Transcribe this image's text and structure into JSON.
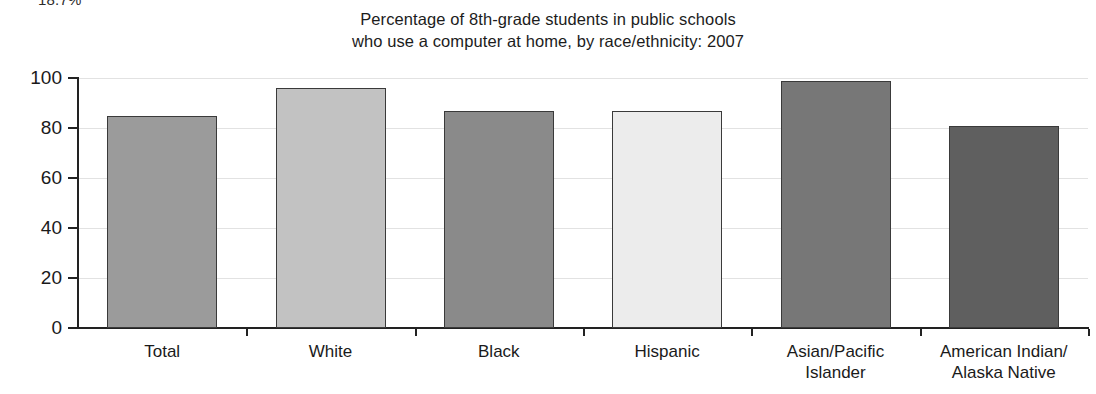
{
  "page": {
    "clipped_fragment_above": "18.7%"
  },
  "chart_data": {
    "type": "bar",
    "title": "Percentage of 8th-grade students in public schools who use a computer at home, by race/ethnicity: 2007",
    "title_lines": [
      "Percentage of 8th-grade students in public schools",
      "who use a computer at home, by race/ethnicity: 2007"
    ],
    "xlabel": "",
    "ylabel": "",
    "ylim": [
      0,
      100
    ],
    "yticks": [
      0,
      20,
      40,
      60,
      80,
      100
    ],
    "ytick_labels": [
      "0",
      "20",
      "40",
      "60",
      "80",
      "100"
    ],
    "grid": true,
    "legend": "none",
    "categories": [
      "Total",
      "White",
      "Black",
      "Hispanic",
      "Asian/Pacific Islander",
      "American Indian/ Alaska Native"
    ],
    "category_lines": [
      [
        "Total",
        ""
      ],
      [
        "White",
        ""
      ],
      [
        "Black",
        ""
      ],
      [
        "Hispanic",
        ""
      ],
      [
        "Asian/Pacific",
        "Islander"
      ],
      [
        "American Indian/",
        "Alaska Native"
      ]
    ],
    "values": [
      85,
      96,
      87,
      87,
      99,
      81
    ],
    "bar_colors": [
      "#9b9b9b",
      "#c2c2c2",
      "#8a8a8a",
      "#ececec",
      "#777777",
      "#5f5f5f"
    ],
    "bar_border_color": "#3a3a3a",
    "gridline_color": "#e2e2e2",
    "axis_color": "#222222"
  }
}
